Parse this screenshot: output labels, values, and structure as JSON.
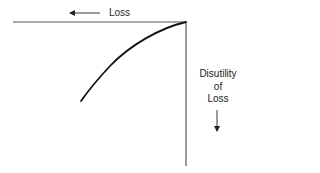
{
  "diagram": {
    "type": "value-function-loss-quadrant",
    "colors": {
      "background": "#ffffff",
      "axes": "#555555",
      "curve": "#111111",
      "text": "#222222"
    },
    "horizontal_axis": {
      "label": "Loss",
      "arrow_direction": "left"
    },
    "vertical_axis": {
      "label_lines": [
        "Disutility",
        "of",
        "Loss"
      ],
      "arrow_direction": "down"
    },
    "curve": {
      "description": "concave curve from origin sloping down-left",
      "points": [
        [
          186,
          22
        ],
        [
          170,
          27
        ],
        [
          150,
          36
        ],
        [
          125,
          52
        ],
        [
          100,
          78
        ],
        [
          81,
          101
        ]
      ]
    }
  }
}
